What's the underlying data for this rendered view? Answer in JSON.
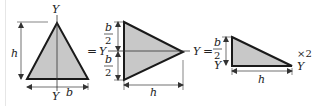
{
  "colors": {
    "fill": "#c8c8c8",
    "stroke": "#1a1a1a",
    "dim": "#333333"
  },
  "figure1": {
    "axis_top": "Y",
    "axis_bottom": "Y",
    "height_label": "h",
    "base_label": "b"
  },
  "eq1": "=",
  "figure2": {
    "axis_left": "Y",
    "axis_right": "Y",
    "half_top_num": "b",
    "half_top_den": "2",
    "half_bot_num": "b",
    "half_bot_den": "2",
    "length_label": "h"
  },
  "eq2": "=",
  "figure3": {
    "axis_left": "Y",
    "axis_right": "Y",
    "half_num": "b",
    "half_den": "2",
    "length_label": "h",
    "multiplier": "×2"
  }
}
